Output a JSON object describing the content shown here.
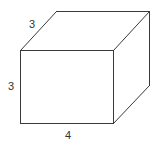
{
  "diagram": {
    "type": "rectangular-prism",
    "labels": {
      "depth": "3",
      "height": "3",
      "width": "4"
    },
    "colors": {
      "edge": "#3a3a3a",
      "label": "#333333",
      "background": "#ffffff"
    }
  }
}
